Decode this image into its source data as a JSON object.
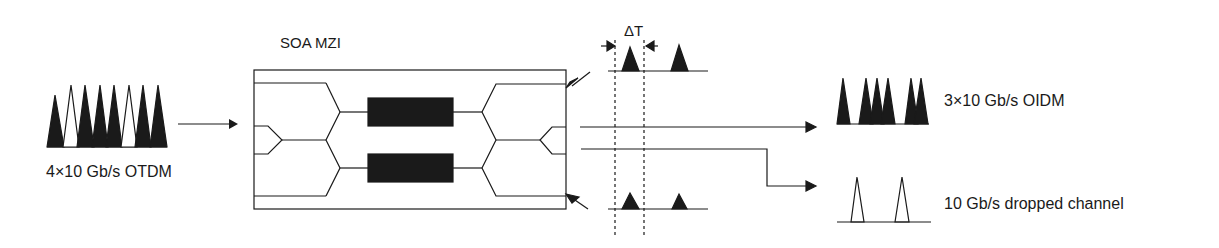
{
  "diagram": {
    "title": "SOA MZI",
    "input": {
      "label": "4×10 Gb/s OTDM",
      "pulses": [
        "filled",
        "open",
        "filled",
        "filled",
        "filled",
        "open",
        "filled",
        "filled"
      ]
    },
    "output_through": {
      "label": "3×10 Gb/s OIDM",
      "pulses": [
        "filled",
        "gap",
        "filled",
        "filled",
        "filled",
        "gap",
        "filled",
        "filled"
      ]
    },
    "output_drop": {
      "label": "10 Gb/s dropped channel",
      "pulses": [
        "open",
        "open"
      ]
    },
    "control_label": "ΔT",
    "colors": {
      "ink": "#1a1a1a",
      "background": "#ffffff"
    }
  }
}
